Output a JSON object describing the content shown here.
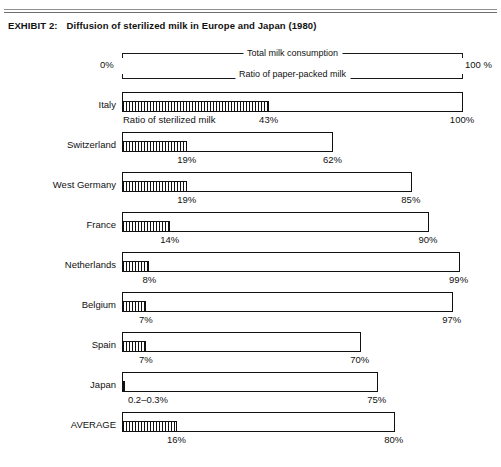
{
  "document": {
    "exhibit_number": "EXHIBIT 2:",
    "title": "Diffusion of sterilized milk in Europe and Japan (1980)"
  },
  "scale": {
    "min_label": "0%",
    "max_label": "100 %",
    "legend_total": "Total milk consumption",
    "legend_paper": "Ratio of paper-packed milk",
    "legend_sterilized": "Ratio of sterilized milk"
  },
  "chart_data": {
    "type": "bar",
    "title": "Diffusion of sterilized milk in Europe and Japan (1980)",
    "xlabel": "",
    "ylabel": "",
    "xlim": [
      0,
      100
    ],
    "grid": false,
    "orientation": "horizontal",
    "legend_position": "top",
    "categories": [
      "Italy",
      "Switzerland",
      "West Germany",
      "France",
      "Netherlands",
      "Belgium",
      "Spain",
      "Japan",
      "AVERAGE"
    ],
    "series": [
      {
        "name": "Ratio of paper-packed milk",
        "values": [
          100,
          62,
          85,
          90,
          99,
          97,
          70,
          75,
          80
        ],
        "labels": [
          "100%",
          "62%",
          "85%",
          "90%",
          "99%",
          "97%",
          "70%",
          "75%",
          "80%"
        ]
      },
      {
        "name": "Ratio of sterilized milk",
        "values": [
          43,
          19,
          19,
          14,
          8,
          7,
          7,
          0.25,
          16
        ],
        "labels": [
          "43%",
          "19%",
          "19%",
          "14%",
          "8%",
          "7%",
          "7%",
          "0.2-0.3%",
          "16%"
        ]
      }
    ]
  },
  "rows": [
    {
      "label": "Italy",
      "outer_value": 100,
      "outer_label": "100%",
      "inner_value": 43,
      "inner_label": "43%",
      "show_series_label": true
    },
    {
      "label": "Switzerland",
      "outer_value": 62,
      "outer_label": "62%",
      "inner_value": 19,
      "inner_label": "19%",
      "show_series_label": false
    },
    {
      "label": "West Germany",
      "outer_value": 85,
      "outer_label": "85%",
      "inner_value": 19,
      "inner_label": "19%",
      "show_series_label": false
    },
    {
      "label": "France",
      "outer_value": 90,
      "outer_label": "90%",
      "inner_value": 14,
      "inner_label": "14%",
      "show_series_label": false
    },
    {
      "label": "Netherlands",
      "outer_value": 99,
      "outer_label": "99%",
      "inner_value": 8,
      "inner_label": "8%",
      "show_series_label": false
    },
    {
      "label": "Belgium",
      "outer_value": 97,
      "outer_label": "97%",
      "inner_value": 7,
      "inner_label": "7%",
      "show_series_label": false
    },
    {
      "label": "Spain",
      "outer_value": 70,
      "outer_label": "70%",
      "inner_value": 7,
      "inner_label": "7%",
      "show_series_label": false
    },
    {
      "label": "Japan",
      "outer_value": 75,
      "outer_label": "75%",
      "inner_value": 0.25,
      "inner_label": "0.2–0.3%",
      "show_series_label": false
    },
    {
      "label": "AVERAGE",
      "outer_value": 80,
      "outer_label": "80%",
      "inner_value": 16,
      "inner_label": "16%",
      "show_series_label": false
    }
  ],
  "colors": {
    "ink": "#111111",
    "rule": "#8f8f8f",
    "paper": "#ffffff"
  }
}
